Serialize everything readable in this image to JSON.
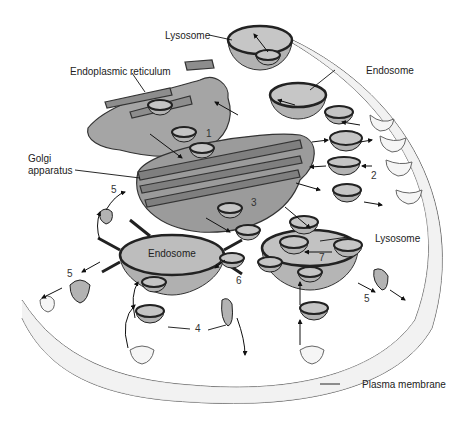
{
  "diagram": {
    "type": "endocytic and secretory pathways",
    "labels": {
      "lysosome_top": "Lysosome",
      "er": "Endoplasmic reticulum",
      "endosome_top": "Endosome",
      "golgi_line1": "Golgi",
      "golgi_line2": "apparatus",
      "endosome_center": "Endosome",
      "lysosome_right": "Lysosome",
      "plasma_membrane": "Plasma membrane"
    },
    "step_numbers": {
      "n1": "1",
      "n2": "2",
      "n3": "3",
      "n4": "4",
      "n5a": "5",
      "n5b": "5",
      "n5c": "5",
      "n6": "6",
      "n7": "7"
    },
    "colors": {
      "organelle_fill": "#a9a9a9",
      "organelle_rim": "#2a2a2a",
      "membrane_fill": "#eeeeee",
      "text": "#222222"
    }
  }
}
